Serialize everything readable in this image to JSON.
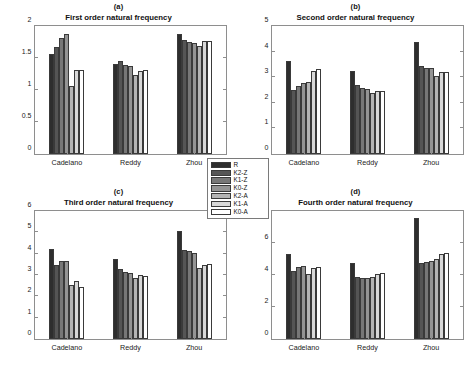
{
  "figure": {
    "width": 474,
    "height": 370,
    "background": "#ffffff"
  },
  "legend": {
    "name": "series-legend",
    "entries": [
      {
        "label": "R",
        "color": "#2e2e2e"
      },
      {
        "label": "K2-Z",
        "color": "#555555"
      },
      {
        "label": "K1-Z",
        "color": "#777777"
      },
      {
        "label": "K0-Z",
        "color": "#949494"
      },
      {
        "label": "K2-A",
        "color": "#b4b4b4"
      },
      {
        "label": "K1-A",
        "color": "#d8d8d8"
      },
      {
        "label": "K0-A",
        "color": "#ffffff"
      }
    ]
  },
  "chart_data": [
    {
      "type": "bar",
      "panel": "a",
      "title": "First order natural frequency",
      "xlabel": "",
      "ylabel": "",
      "ylim": [
        0,
        2
      ],
      "yticks": [
        0,
        0.5,
        1,
        1.5,
        2
      ],
      "ytick_labels": [
        "0",
        "0.5",
        "1",
        "1.5",
        "2"
      ],
      "grid": false,
      "categories": [
        "Cadelano",
        "Reddy",
        "Zhou"
      ],
      "series": [
        {
          "name": "R",
          "values": [
            1.57,
            1.4,
            1.88
          ]
        },
        {
          "name": "K2-Z",
          "values": [
            1.67,
            1.45,
            1.78
          ]
        },
        {
          "name": "K1-Z",
          "values": [
            1.82,
            1.39,
            1.75
          ]
        },
        {
          "name": "K0-Z",
          "values": [
            1.88,
            1.37,
            1.74
          ]
        },
        {
          "name": "K2-A",
          "values": [
            1.06,
            1.23,
            1.68
          ]
        },
        {
          "name": "K1-A",
          "values": [
            1.32,
            1.29,
            1.76
          ]
        },
        {
          "name": "K0-A",
          "values": [
            1.32,
            1.31,
            1.76
          ]
        }
      ]
    },
    {
      "type": "bar",
      "panel": "b",
      "title": "Second order natural frequency",
      "xlabel": "",
      "ylabel": "",
      "ylim": [
        0,
        5
      ],
      "yticks": [
        0,
        1,
        2,
        3,
        4,
        5
      ],
      "ytick_labels": [
        "0",
        "1",
        "2",
        "3",
        "4",
        "5"
      ],
      "grid": false,
      "categories": [
        "Cadelano",
        "Reddy",
        "Zhou"
      ],
      "series": [
        {
          "name": "R",
          "values": [
            3.63,
            3.24,
            4.36
          ]
        },
        {
          "name": "K2-Z",
          "values": [
            2.49,
            2.68,
            3.42
          ]
        },
        {
          "name": "K1-Z",
          "values": [
            2.64,
            2.57,
            3.37
          ]
        },
        {
          "name": "K0-Z",
          "values": [
            2.76,
            2.53,
            3.35
          ]
        },
        {
          "name": "K2-A",
          "values": [
            2.81,
            2.38,
            3.06
          ]
        },
        {
          "name": "K1-A",
          "values": [
            3.25,
            2.46,
            3.21
          ]
        },
        {
          "name": "K0-A",
          "values": [
            3.31,
            2.47,
            3.2
          ]
        }
      ]
    },
    {
      "type": "bar",
      "panel": "c",
      "title": "Third order natural frequency",
      "xlabel": "",
      "ylabel": "",
      "ylim": [
        0,
        6
      ],
      "yticks": [
        0,
        1,
        2,
        3,
        4,
        5,
        6
      ],
      "ytick_labels": [
        "0",
        "1",
        "2",
        "3",
        "4",
        "5",
        "6"
      ],
      "grid": false,
      "categories": [
        "Cadelano",
        "Reddy",
        "Zhou"
      ],
      "series": [
        {
          "name": "R",
          "values": [
            4.2,
            3.74,
            5.05
          ]
        },
        {
          "name": "K2-Z",
          "values": [
            3.46,
            3.27,
            4.17
          ]
        },
        {
          "name": "K1-Z",
          "values": [
            3.65,
            3.16,
            4.11
          ]
        },
        {
          "name": "K0-Z",
          "values": [
            3.65,
            3.11,
            4.02
          ]
        },
        {
          "name": "K2-A",
          "values": [
            2.53,
            2.88,
            3.33
          ]
        },
        {
          "name": "K1-A",
          "values": [
            2.72,
            2.98,
            3.48
          ]
        },
        {
          "name": "K0-A",
          "values": [
            2.42,
            2.97,
            3.5
          ]
        }
      ]
    },
    {
      "type": "bar",
      "panel": "d",
      "title": "Fourth order natural frequency",
      "xlabel": "",
      "ylabel": "",
      "ylim": [
        0,
        8
      ],
      "yticks": [
        0,
        2,
        4,
        6,
        8
      ],
      "ytick_labels": [
        "0",
        "2",
        "4",
        "6",
        "8"
      ],
      "grid": false,
      "categories": [
        "Cadelano",
        "Reddy",
        "Zhou"
      ],
      "series": [
        {
          "name": "R",
          "values": [
            5.3,
            4.72,
            7.55
          ]
        },
        {
          "name": "K2-Z",
          "values": [
            4.26,
            3.9,
            4.78
          ]
        },
        {
          "name": "K1-Z",
          "values": [
            4.52,
            3.84,
            4.79
          ]
        },
        {
          "name": "K0-Z",
          "values": [
            4.57,
            3.79,
            4.88
          ]
        },
        {
          "name": "K2-A",
          "values": [
            4.06,
            3.89,
            5.03
          ]
        },
        {
          "name": "K1-A",
          "values": [
            4.46,
            4.04,
            5.32
          ]
        },
        {
          "name": "K0-A",
          "values": [
            4.53,
            4.12,
            5.4
          ]
        }
      ]
    }
  ]
}
